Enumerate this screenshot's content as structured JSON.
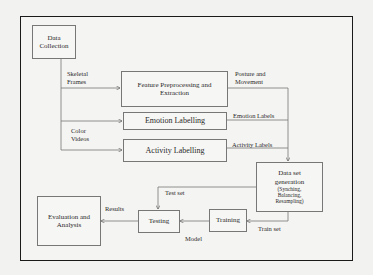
{
  "diagram": {
    "nodes": {
      "data_collection": "Data Collection",
      "data_collection_l1": "Data",
      "data_collection_l2": "Collection",
      "feature_l1": "Feature Preprocessing and",
      "feature_l2": "Extraction",
      "emotion": "Emotion Labelling",
      "activity": "Activity Labelling",
      "dataset_l1": "Data set",
      "dataset_l2": "generation",
      "dataset_l3": "(Synching,",
      "dataset_l4": "Balancing,",
      "dataset_l5": "Resampling)",
      "testing": "Testing",
      "training": "Training",
      "evaluation_l1": "Evaluation and",
      "evaluation_l2": "Analysis"
    },
    "edge_labels": {
      "skeletal_l1": "Skeletal",
      "skeletal_l2": "Frames",
      "color_l1": "Color",
      "color_l2": "Videos",
      "posture_l1": "Posture and",
      "posture_l2": "Movement",
      "emotion_labels": "Emotion Labels",
      "activity_labels": "Activity Labels",
      "test_set": "Test set",
      "train_set": "Train set",
      "model": "Model",
      "results": "Results"
    },
    "edges": [
      {
        "from": "Data Collection",
        "to": "Feature Preprocessing and Extraction",
        "label": "Skeletal Frames"
      },
      {
        "from": "Data Collection",
        "to": "Emotion Labelling",
        "label": ""
      },
      {
        "from": "Data Collection",
        "to": "Activity Labelling",
        "label": "Color Videos"
      },
      {
        "from": "Feature Preprocessing and Extraction",
        "to": "Data set generation",
        "label": "Posture and Movement"
      },
      {
        "from": "Emotion Labelling",
        "to": "Data set generation",
        "label": "Emotion Labels"
      },
      {
        "from": "Activity Labelling",
        "to": "Data set generation",
        "label": "Activity Labels"
      },
      {
        "from": "Data set generation",
        "to": "Testing",
        "label": "Test set"
      },
      {
        "from": "Data set generation",
        "to": "Training",
        "label": "Train set"
      },
      {
        "from": "Training",
        "to": "Testing",
        "label": "Model"
      },
      {
        "from": "Testing",
        "to": "Evaluation and Analysis",
        "label": "Results"
      }
    ]
  }
}
